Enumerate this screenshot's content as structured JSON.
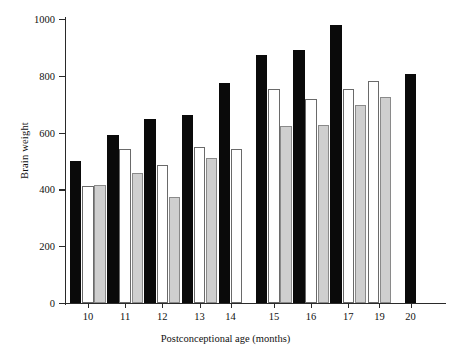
{
  "chart_data": {
    "type": "bar",
    "title": "",
    "xlabel": "Postconceptional age (months)",
    "ylabel": "Brain weight",
    "categories": [
      "10",
      "11",
      "12",
      "13",
      "14",
      "15",
      "16",
      "17",
      "19",
      "20"
    ],
    "ylim": [
      0,
      1000
    ],
    "yticks": [
      0,
      200,
      400,
      600,
      800,
      1000
    ],
    "ytick_labels": [
      "0",
      "200",
      "400",
      "600",
      "800",
      "1000"
    ],
    "grid": false,
    "legend": "none",
    "series": [
      {
        "name": "black",
        "color": "#0a0a0a",
        "values": [
          500,
          592,
          647,
          663,
          775,
          873,
          890,
          978,
          null,
          805
        ]
      },
      {
        "name": "white",
        "color": "#ffffff",
        "values": [
          413,
          543,
          485,
          549,
          543,
          752,
          718,
          752,
          782,
          null
        ]
      },
      {
        "name": "gray",
        "color": "#cfcfcf",
        "values": [
          414,
          457,
          375,
          512,
          null,
          625,
          628,
          698,
          725,
          null
        ]
      }
    ]
  },
  "axis": {
    "y_title": "Brain weight",
    "x_title": "Postconceptional age (months)"
  }
}
